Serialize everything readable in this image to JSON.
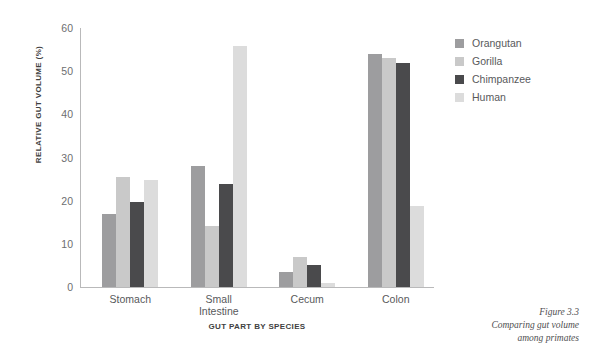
{
  "chart_data": {
    "type": "bar",
    "title": "",
    "xlabel": "GUT PART BY SPECIES",
    "ylabel": "RELATIVE GUT VOLUME (%)",
    "ylim": [
      0,
      60
    ],
    "yticks": [
      0,
      10,
      20,
      30,
      40,
      50,
      60
    ],
    "ytick_labels": [
      "0",
      "10",
      "20",
      "30",
      "40",
      "50",
      "60"
    ],
    "grid": false,
    "legend_position": "right",
    "categories": [
      "Stomach",
      "Small Intestine",
      "Cecum",
      "Colon"
    ],
    "series": [
      {
        "name": "Orangutan",
        "color": "#9d9d9f",
        "values": [
          17.0,
          28.0,
          3.5,
          54.0
        ]
      },
      {
        "name": "Gorilla",
        "color": "#c9c9c9",
        "values": [
          25.5,
          14.2,
          7.0,
          53.0
        ]
      },
      {
        "name": "Chimpanzee",
        "color": "#4a4a4c",
        "values": [
          19.8,
          23.8,
          5.0,
          52.0
        ]
      },
      {
        "name": "Human",
        "color": "#dcdcdc",
        "values": [
          24.8,
          55.8,
          1.0,
          18.7
        ]
      }
    ]
  },
  "caption": {
    "figure_number": "Figure 3.3",
    "line1": "Comparing gut volume",
    "line2": "among primates"
  }
}
